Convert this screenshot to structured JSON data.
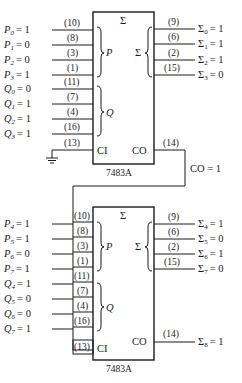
{
  "diagram": {
    "upper_adder": {
      "chip_label": "7483A",
      "sum_header": "Σ",
      "group_p_label": "P",
      "group_q_label": "Q",
      "group_sum_label": "Σ",
      "ci_label": "CI",
      "co_label": "CO",
      "inputs_p": [
        {
          "name": "P",
          "sub": "0",
          "value": "= 1",
          "pin": "(10)"
        },
        {
          "name": "P",
          "sub": "1",
          "value": "= 0",
          "pin": "(8)"
        },
        {
          "name": "P",
          "sub": "2",
          "value": "= 0",
          "pin": "(3)"
        },
        {
          "name": "P",
          "sub": "3",
          "value": "= 1",
          "pin": "(1)"
        }
      ],
      "inputs_q": [
        {
          "name": "Q",
          "sub": "0",
          "value": "= 0",
          "pin": "(11)"
        },
        {
          "name": "Q",
          "sub": "1",
          "value": "= 1",
          "pin": "(7)"
        },
        {
          "name": "Q",
          "sub": "2",
          "value": "= 1",
          "pin": "(4)"
        },
        {
          "name": "Q",
          "sub": "3",
          "value": "= 1",
          "pin": "(16)"
        }
      ],
      "ci_pin": "(13)",
      "outputs": [
        {
          "name": "Σ",
          "sub": "0",
          "value": "= 1",
          "pin": "(9)"
        },
        {
          "name": "Σ",
          "sub": "1",
          "value": "= 1",
          "pin": "(6)"
        },
        {
          "name": "Σ",
          "sub": "2",
          "value": "= 1",
          "pin": "(2)"
        },
        {
          "name": "Σ",
          "sub": "3",
          "value": "= 0",
          "pin": "(15)"
        }
      ],
      "co_pin": "(14)"
    },
    "carry_link_label": "CO = 1",
    "lower_adder": {
      "chip_label": "7483A",
      "sum_header": "Σ",
      "group_p_label": "P",
      "group_q_label": "Q",
      "group_sum_label": "Σ",
      "ci_label": "CI",
      "co_label": "CO",
      "inputs_p": [
        {
          "name": "P",
          "sub": "4",
          "value": "= 1",
          "pin": "(10)"
        },
        {
          "name": "P",
          "sub": "5",
          "value": "= 1",
          "pin": "(8)"
        },
        {
          "name": "P",
          "sub": "6",
          "value": "= 0",
          "pin": "(3)"
        },
        {
          "name": "P",
          "sub": "7",
          "value": "= 1",
          "pin": "(1)"
        }
      ],
      "inputs_q": [
        {
          "name": "Q",
          "sub": "4",
          "value": "= 1",
          "pin": "(11)"
        },
        {
          "name": "Q",
          "sub": "5",
          "value": "= 0",
          "pin": "(7)"
        },
        {
          "name": "Q",
          "sub": "6",
          "value": "= 0",
          "pin": "(4)"
        },
        {
          "name": "Q",
          "sub": "7",
          "value": "= 1",
          "pin": "(16)"
        }
      ],
      "ci_pin": "(13)",
      "outputs": [
        {
          "name": "Σ",
          "sub": "4",
          "value": "= 1",
          "pin": "(9)"
        },
        {
          "name": "Σ",
          "sub": "5",
          "value": "= 0",
          "pin": "(6)"
        },
        {
          "name": "Σ",
          "sub": "6",
          "value": "= 1",
          "pin": "(2)"
        },
        {
          "name": "Σ",
          "sub": "7",
          "value": "= 0",
          "pin": "(15)"
        }
      ],
      "co_pin": "(14)",
      "final_carry": {
        "name": "Σ",
        "sub": "8",
        "value": "= 1"
      }
    }
  }
}
